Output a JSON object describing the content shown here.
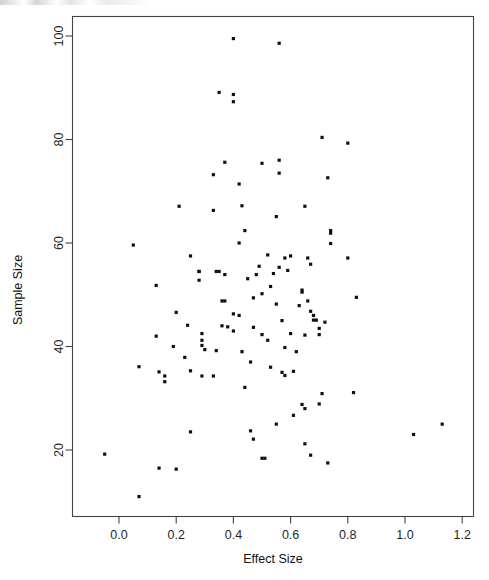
{
  "chart_data": {
    "type": "scatter",
    "title": "",
    "xlabel": "Effect Size",
    "ylabel": "Sample Size",
    "xlim": [
      -0.09,
      1.24
    ],
    "ylim": [
      8.5,
      103
    ],
    "xticks": [
      "0.0",
      "0.2",
      "0.4",
      "0.6",
      "0.8",
      "1.0",
      "1.2"
    ],
    "xtick_values": [
      0.0,
      0.2,
      0.4,
      0.6,
      0.8,
      1.0,
      1.2
    ],
    "yticks": [
      "20",
      "40",
      "60",
      "80",
      "100"
    ],
    "ytick_values": [
      20,
      40,
      60,
      80,
      100
    ],
    "grid": false,
    "legend": null,
    "marker": "filled-square",
    "marker_color": "#111111",
    "point_count": 120,
    "points": [
      [
        0.4,
        99.5
      ],
      [
        0.56,
        98.6
      ],
      [
        0.35,
        89.1
      ],
      [
        0.4,
        88.7
      ],
      [
        0.4,
        87.3
      ],
      [
        0.71,
        80.4
      ],
      [
        0.8,
        79.3
      ],
      [
        0.37,
        75.6
      ],
      [
        0.5,
        75.4
      ],
      [
        0.56,
        76.0
      ],
      [
        0.33,
        73.2
      ],
      [
        0.56,
        73.5
      ],
      [
        0.73,
        72.6
      ],
      [
        0.42,
        71.4
      ],
      [
        0.21,
        67.1
      ],
      [
        0.43,
        67.2
      ],
      [
        0.65,
        67.1
      ],
      [
        0.33,
        66.3
      ],
      [
        0.55,
        65.1
      ],
      [
        0.44,
        62.4
      ],
      [
        0.74,
        62.4
      ],
      [
        0.74,
        61.9
      ],
      [
        0.42,
        60.0
      ],
      [
        0.74,
        59.9
      ],
      [
        0.05,
        59.6
      ],
      [
        0.25,
        57.5
      ],
      [
        0.8,
        57.1
      ],
      [
        0.52,
        57.7
      ],
      [
        0.58,
        57.1
      ],
      [
        0.6,
        57.5
      ],
      [
        0.66,
        57.1
      ],
      [
        0.67,
        55.9
      ],
      [
        0.49,
        55.5
      ],
      [
        0.56,
        55.3
      ],
      [
        0.45,
        53.1
      ],
      [
        0.54,
        54.1
      ],
      [
        0.28,
        54.5
      ],
      [
        0.28,
        54.5
      ],
      [
        0.34,
        54.5
      ],
      [
        0.35,
        54.5
      ],
      [
        0.37,
        53.9
      ],
      [
        0.48,
        53.9
      ],
      [
        0.59,
        54.7
      ],
      [
        0.28,
        52.8
      ],
      [
        0.13,
        51.8
      ],
      [
        0.53,
        51.6
      ],
      [
        0.64,
        50.5
      ],
      [
        0.64,
        50.9
      ],
      [
        0.66,
        48.8
      ],
      [
        0.83,
        49.5
      ],
      [
        0.36,
        48.8
      ],
      [
        0.37,
        48.8
      ],
      [
        0.47,
        49.4
      ],
      [
        0.5,
        50.2
      ],
      [
        0.55,
        48.2
      ],
      [
        0.67,
        46.8
      ],
      [
        0.68,
        46.0
      ],
      [
        0.42,
        46.0
      ],
      [
        0.4,
        46.3
      ],
      [
        0.2,
        46.6
      ],
      [
        0.68,
        45.1
      ],
      [
        0.69,
        45.1
      ],
      [
        0.4,
        43.0
      ],
      [
        0.29,
        42.5
      ],
      [
        0.13,
        42.0
      ],
      [
        0.5,
        42.3
      ],
      [
        0.6,
        42.5
      ],
      [
        0.65,
        42.2
      ],
      [
        0.7,
        42.3
      ],
      [
        0.29,
        41.2
      ],
      [
        0.47,
        43.7
      ],
      [
        0.7,
        43.5
      ],
      [
        0.29,
        40.2
      ],
      [
        0.23,
        37.9
      ],
      [
        0.07,
        36.1
      ],
      [
        0.14,
        35.1
      ],
      [
        0.16,
        34.3
      ],
      [
        0.25,
        35.3
      ],
      [
        0.29,
        34.3
      ],
      [
        0.33,
        34.3
      ],
      [
        0.46,
        37.0
      ],
      [
        0.53,
        36.0
      ],
      [
        0.57,
        35.0
      ],
      [
        0.58,
        34.4
      ],
      [
        0.61,
        35.2
      ],
      [
        0.44,
        32.1
      ],
      [
        0.16,
        33.2
      ],
      [
        0.82,
        31.1
      ],
      [
        1.03,
        23.0
      ],
      [
        1.13,
        25.0
      ],
      [
        0.71,
        30.9
      ],
      [
        0.64,
        28.8
      ],
      [
        -0.05,
        19.2
      ],
      [
        0.07,
        11.0
      ],
      [
        0.14,
        16.5
      ],
      [
        0.2,
        16.3
      ],
      [
        0.25,
        23.5
      ],
      [
        0.46,
        23.7
      ],
      [
        0.47,
        22.1
      ],
      [
        0.5,
        18.4
      ],
      [
        0.51,
        18.4
      ],
      [
        0.55,
        25.0
      ],
      [
        0.65,
        28.0
      ],
      [
        0.65,
        21.2
      ],
      [
        0.67,
        19.0
      ],
      [
        0.7,
        28.9
      ],
      [
        0.73,
        17.5
      ],
      [
        0.61,
        26.7
      ],
      [
        0.57,
        45.0
      ],
      [
        0.63,
        47.9
      ],
      [
        0.72,
        44.7
      ],
      [
        0.36,
        44.0
      ],
      [
        0.38,
        43.8
      ],
      [
        0.52,
        41.2
      ],
      [
        0.58,
        39.8
      ],
      [
        0.43,
        39.0
      ],
      [
        0.3,
        39.4
      ],
      [
        0.34,
        39.2
      ],
      [
        0.62,
        39.0
      ],
      [
        0.24,
        44.1
      ],
      [
        0.19,
        40.0
      ]
    ]
  }
}
